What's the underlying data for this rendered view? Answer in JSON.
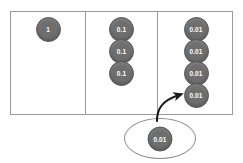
{
  "diagram": {
    "columns": [
      {
        "name": "ones",
        "counters": [
          {
            "value": "1"
          }
        ]
      },
      {
        "name": "tenths",
        "counters": [
          {
            "value": "0.1"
          },
          {
            "value": "0.1"
          },
          {
            "value": "0.1"
          }
        ]
      },
      {
        "name": "hundredths",
        "counters": [
          {
            "value": "0.01"
          },
          {
            "value": "0.01"
          },
          {
            "value": "0.01"
          },
          {
            "value": "0.01"
          }
        ]
      }
    ],
    "incoming": {
      "name": "incoming-counter",
      "value": "0.01"
    },
    "arrow": {
      "name": "move-arrow",
      "direction": "up-right"
    },
    "colors": {
      "counter_fill": "#6e6e6e",
      "counter_stroke": "#585858",
      "counter_text": "#ffffff",
      "grid_line": "#9a9a9a",
      "oval_stroke": "#8f8f8f",
      "arrow": "#1a1a1a",
      "background": "#ffffff"
    }
  }
}
